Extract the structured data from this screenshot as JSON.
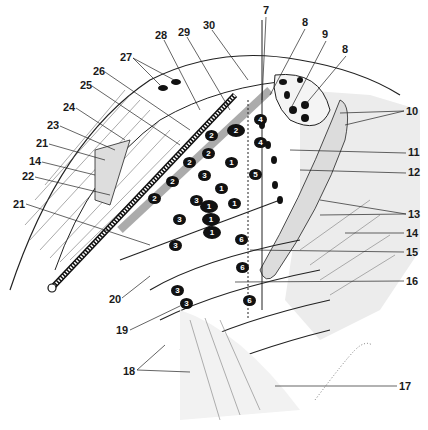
{
  "figure": {
    "background": "#ffffff",
    "ink": "#1a1a1a",
    "shade": "#d9d9d9"
  },
  "callouts": [
    {
      "id": "c27",
      "text": "27",
      "x": 120,
      "y": 52
    },
    {
      "id": "c28",
      "text": "28",
      "x": 155,
      "y": 30
    },
    {
      "id": "c29",
      "text": "29",
      "x": 178,
      "y": 27
    },
    {
      "id": "c30",
      "text": "30",
      "x": 203,
      "y": 20
    },
    {
      "id": "c7",
      "text": "7",
      "x": 263,
      "y": 5
    },
    {
      "id": "c8a",
      "text": "8",
      "x": 302,
      "y": 17
    },
    {
      "id": "c9",
      "text": "9",
      "x": 322,
      "y": 29
    },
    {
      "id": "c8b",
      "text": "8",
      "x": 342,
      "y": 44
    },
    {
      "id": "c26",
      "text": "26",
      "x": 93,
      "y": 66
    },
    {
      "id": "c25",
      "text": "25",
      "x": 80,
      "y": 80
    },
    {
      "id": "c24",
      "text": "24",
      "x": 63,
      "y": 102
    },
    {
      "id": "c23",
      "text": "23",
      "x": 47,
      "y": 120
    },
    {
      "id": "c21a",
      "text": "21",
      "x": 36,
      "y": 138
    },
    {
      "id": "c14a",
      "text": "14",
      "x": 29,
      "y": 156
    },
    {
      "id": "c22",
      "text": "22",
      "x": 22,
      "y": 171
    },
    {
      "id": "c21b",
      "text": "21",
      "x": 13,
      "y": 199
    },
    {
      "id": "c10",
      "text": "10",
      "x": 406,
      "y": 106
    },
    {
      "id": "c11",
      "text": "11",
      "x": 408,
      "y": 147
    },
    {
      "id": "c12",
      "text": "12",
      "x": 408,
      "y": 167
    },
    {
      "id": "c13",
      "text": "13",
      "x": 408,
      "y": 209
    },
    {
      "id": "c14b",
      "text": "14",
      "x": 406,
      "y": 228
    },
    {
      "id": "c15",
      "text": "15",
      "x": 406,
      "y": 247
    },
    {
      "id": "c16",
      "text": "16",
      "x": 406,
      "y": 276
    },
    {
      "id": "c20",
      "text": "20",
      "x": 109,
      "y": 294
    },
    {
      "id": "c19",
      "text": "19",
      "x": 116,
      "y": 325
    },
    {
      "id": "c18",
      "text": "18",
      "x": 123,
      "y": 366
    },
    {
      "id": "c17",
      "text": "17",
      "x": 399,
      "y": 381
    }
  ],
  "nodes": [
    {
      "text": "2",
      "x": 227,
      "y": 124,
      "big": true
    },
    {
      "text": "2",
      "x": 205,
      "y": 130,
      "big": false
    },
    {
      "text": "2",
      "x": 202,
      "y": 148,
      "big": false
    },
    {
      "text": "2",
      "x": 183,
      "y": 157,
      "big": false
    },
    {
      "text": "2",
      "x": 166,
      "y": 176,
      "big": false
    },
    {
      "text": "2",
      "x": 148,
      "y": 193,
      "big": false
    },
    {
      "text": "3",
      "x": 198,
      "y": 170,
      "big": false
    },
    {
      "text": "3",
      "x": 190,
      "y": 195,
      "big": false
    },
    {
      "text": "3",
      "x": 173,
      "y": 214,
      "big": false
    },
    {
      "text": "3",
      "x": 169,
      "y": 240,
      "big": false
    },
    {
      "text": "3",
      "x": 171,
      "y": 285,
      "big": false
    },
    {
      "text": "3",
      "x": 180,
      "y": 298,
      "big": false
    },
    {
      "text": "1",
      "x": 225,
      "y": 157,
      "big": false
    },
    {
      "text": "1",
      "x": 215,
      "y": 183,
      "big": false
    },
    {
      "text": "1",
      "x": 200,
      "y": 200,
      "big": true
    },
    {
      "text": "1",
      "x": 228,
      "y": 198,
      "big": false
    },
    {
      "text": "1",
      "x": 202,
      "y": 213,
      "big": true
    },
    {
      "text": "1",
      "x": 203,
      "y": 226,
      "big": true
    },
    {
      "text": "4",
      "x": 254,
      "y": 114,
      "big": false
    },
    {
      "text": "4",
      "x": 254,
      "y": 137,
      "big": false
    },
    {
      "text": "5",
      "x": 249,
      "y": 169,
      "big": false
    },
    {
      "text": "6",
      "x": 235,
      "y": 234,
      "big": false
    },
    {
      "text": "6",
      "x": 236,
      "y": 262,
      "big": false
    },
    {
      "text": "6",
      "x": 243,
      "y": 295,
      "big": false
    }
  ]
}
